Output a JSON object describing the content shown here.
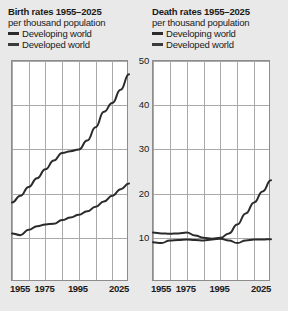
{
  "background_color": "#e9e9e9",
  "plot_background": "#ffffff",
  "grid_color": "#a9a9a9",
  "line_color": "#2b2b2b",
  "panels": [
    {
      "id": "birth-rates",
      "title": "Birth rates 1955–2025",
      "subtitle": "per thousand population",
      "legend": [
        {
          "label": "Developing world",
          "color": "#2b2b2b"
        },
        {
          "label": "Developed world",
          "color": "#3a3a3a"
        }
      ]
    },
    {
      "id": "death-rates",
      "title": "Death rates 1955–2025",
      "subtitle": "per thousand population",
      "legend": [
        {
          "label": "Developing world",
          "color": "#2b2b2b"
        },
        {
          "label": "Developed world",
          "color": "#3a3a3a"
        }
      ]
    }
  ],
  "axis": {
    "y_ticks": [
      50,
      40,
      30,
      20,
      10
    ],
    "y_min": 0,
    "y_max": 50,
    "x_ticks": [
      1955,
      1975,
      1995,
      2025
    ],
    "x_gridline_years": [
      1955,
      1965,
      1975,
      1985,
      1995,
      2005,
      2015,
      2025
    ],
    "x_min": 1955,
    "x_max": 2025
  },
  "chart_data": [
    {
      "type": "line",
      "title": "Birth rates 1955–2025",
      "subtitle": "per thousand population",
      "xlabel": "",
      "ylabel": "per thousand population",
      "xlim": [
        1955,
        2025
      ],
      "ylim": [
        0,
        50
      ],
      "grid": true,
      "legend_position": "above-plot",
      "x": [
        1955,
        1960,
        1965,
        1970,
        1975,
        1980,
        1985,
        1990,
        1995,
        2000,
        2005,
        2010,
        2015,
        2020,
        2025
      ],
      "series": [
        {
          "name": "Developing world",
          "values": [
            18.0,
            19.5,
            21.5,
            23.5,
            25.5,
            27.5,
            29.2,
            29.6,
            30.0,
            32.0,
            35.0,
            38.5,
            40.5,
            43.5,
            47.0
          ]
        },
        {
          "name": "Developed world",
          "values": [
            11.0,
            10.6,
            11.8,
            12.6,
            13.0,
            13.2,
            14.0,
            14.6,
            15.2,
            16.0,
            17.0,
            18.2,
            19.5,
            21.0,
            22.3
          ]
        }
      ]
    },
    {
      "type": "line",
      "title": "Death rates 1955–2025",
      "subtitle": "per thousand population",
      "xlabel": "",
      "ylabel": "per thousand population",
      "xlim": [
        1955,
        2025
      ],
      "ylim": [
        0,
        50
      ],
      "grid": true,
      "legend_position": "above-plot",
      "x": [
        1955,
        1960,
        1965,
        1970,
        1975,
        1980,
        1985,
        1990,
        1995,
        2000,
        2005,
        2010,
        2015,
        2020,
        2025
      ],
      "series": [
        {
          "name": "Developing world",
          "values": [
            11.2,
            11.0,
            10.9,
            11.0,
            11.2,
            10.5,
            10.0,
            9.8,
            10.0,
            11.0,
            13.0,
            15.5,
            18.0,
            20.5,
            23.0
          ]
        },
        {
          "name": "Developed world",
          "values": [
            9.0,
            8.8,
            9.4,
            9.5,
            9.6,
            9.5,
            9.4,
            9.6,
            9.8,
            9.4,
            8.8,
            9.4,
            9.6,
            9.6,
            9.7
          ]
        }
      ]
    }
  ]
}
